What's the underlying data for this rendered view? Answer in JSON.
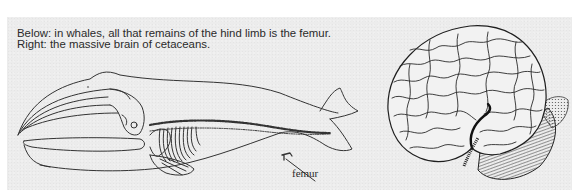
{
  "caption": {
    "line1": "Below: in whales, all that remains of the hind limb is the femur.",
    "line2": "Right: the massive brain of cetaceans."
  },
  "figures": {
    "whale": {
      "description": "whale-skeleton-outline",
      "labels": {
        "femur": "femur"
      }
    },
    "brain": {
      "description": "cetacean-brain-illustration"
    }
  },
  "colors": {
    "panel_background": "#ececec",
    "ink": "#2a2a2a",
    "page": "#ffffff"
  }
}
